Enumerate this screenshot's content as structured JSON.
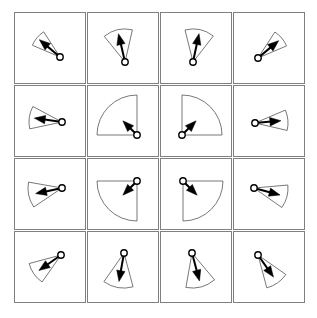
{
  "figure": {
    "title": "",
    "background_color": "#ffffff",
    "grid": {
      "rows": 4,
      "cols": 4,
      "cell_size": 72,
      "gap": 1,
      "origin_x": 14,
      "origin_y": 12,
      "cell_border_color": "#808080",
      "cell_fill_color": "#ffffff",
      "cell_border_width": 1
    },
    "style": {
      "sector_stroke_color": "#555555",
      "sector_fill_color": "none",
      "sector_stroke_width": 0.8,
      "arrow_color": "#000000",
      "arrow_stroke_width": 2.0,
      "vertex_marker_stroke": "#000000",
      "vertex_marker_fill": "#ffffff",
      "vertex_marker_radius": 3.2
    }
  },
  "chart_data": {
    "type": "scatter",
    "title": "",
    "subtitle": "",
    "xlabel": "",
    "ylabel": "",
    "legend": [],
    "annotations": [],
    "grid_on": true,
    "fields": [
      "row",
      "col",
      "apex_x",
      "apex_y",
      "bisector_deg",
      "half_angle_deg",
      "radius",
      "arrow_length"
    ],
    "cells": [
      {
        "row": 0,
        "col": 0,
        "label": "cell-r0-c0",
        "apex_x": 46,
        "apex_y": 45,
        "bisector_deg": 140,
        "half_angle_deg": 17,
        "radius": 30,
        "arrow_length": 27
      },
      {
        "row": 0,
        "col": 1,
        "label": "cell-r0-c1",
        "apex_x": 38,
        "apex_y": 50,
        "bisector_deg": 103,
        "half_angle_deg": 26,
        "radius": 33,
        "arrow_length": 29
      },
      {
        "row": 0,
        "col": 2,
        "label": "cell-r0-c2",
        "apex_x": 33,
        "apex_y": 50,
        "bisector_deg": 78,
        "half_angle_deg": 26,
        "radius": 33,
        "arrow_length": 29
      },
      {
        "row": 0,
        "col": 3,
        "label": "cell-r0-c3",
        "apex_x": 25,
        "apex_y": 46,
        "bisector_deg": 40,
        "half_angle_deg": 17,
        "radius": 31,
        "arrow_length": 27
      },
      {
        "row": 1,
        "col": 0,
        "label": "cell-r1-c0",
        "apex_x": 48,
        "apex_y": 37,
        "bisector_deg": 172,
        "half_angle_deg": 20,
        "radius": 33,
        "arrow_length": 28
      },
      {
        "row": 1,
        "col": 1,
        "label": "cell-r1-c1",
        "apex_x": 50,
        "apex_y": 50,
        "bisector_deg": 135,
        "half_angle_deg": 45,
        "radius": 40,
        "arrow_length": 20
      },
      {
        "row": 1,
        "col": 2,
        "label": "cell-r1-c2",
        "apex_x": 22,
        "apex_y": 50,
        "bisector_deg": 45,
        "half_angle_deg": 45,
        "radius": 40,
        "arrow_length": 20
      },
      {
        "row": 1,
        "col": 3,
        "label": "cell-r1-c3",
        "apex_x": 22,
        "apex_y": 38,
        "bisector_deg": 5,
        "half_angle_deg": 18,
        "radius": 33,
        "arrow_length": 26
      },
      {
        "row": 2,
        "col": 0,
        "label": "cell-r2-c0",
        "apex_x": 48,
        "apex_y": 30,
        "bisector_deg": 192,
        "half_angle_deg": 22,
        "radius": 34,
        "arrow_length": 27
      },
      {
        "row": 2,
        "col": 1,
        "label": "cell-r2-c1",
        "apex_x": 50,
        "apex_y": 23,
        "bisector_deg": 225,
        "half_angle_deg": 45,
        "radius": 40,
        "arrow_length": 20
      },
      {
        "row": 2,
        "col": 2,
        "label": "cell-r2-c2",
        "apex_x": 23,
        "apex_y": 23,
        "bisector_deg": 315,
        "half_angle_deg": 45,
        "radius": 40,
        "arrow_length": 20
      },
      {
        "row": 2,
        "col": 3,
        "label": "cell-r2-c3",
        "apex_x": 21,
        "apex_y": 30,
        "bisector_deg": 345,
        "half_angle_deg": 20,
        "radius": 34,
        "arrow_length": 27
      },
      {
        "row": 3,
        "col": 0,
        "label": "cell-r3-c0",
        "apex_x": 47,
        "apex_y": 24,
        "bisector_deg": 215,
        "half_angle_deg": 20,
        "radius": 33,
        "arrow_length": 27
      },
      {
        "row": 3,
        "col": 1,
        "label": "cell-r3-c1",
        "apex_x": 37,
        "apex_y": 22,
        "bisector_deg": 260,
        "half_angle_deg": 25,
        "radius": 35,
        "arrow_length": 29
      },
      {
        "row": 3,
        "col": 2,
        "label": "cell-r3-c2",
        "apex_x": 32,
        "apex_y": 22,
        "bisector_deg": 285,
        "half_angle_deg": 25,
        "radius": 35,
        "arrow_length": 29
      },
      {
        "row": 3,
        "col": 3,
        "label": "cell-r3-c3",
        "apex_x": 25,
        "apex_y": 24,
        "bisector_deg": 305,
        "half_angle_deg": 20,
        "radius": 34,
        "arrow_length": 27
      }
    ]
  }
}
